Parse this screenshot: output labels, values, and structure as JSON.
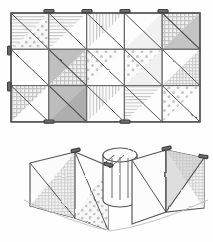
{
  "illustration": {
    "title": "Pencil sketch of a half-square-triangle patchwork quilt",
    "subtitle": "Flat quilt grid above, folded three-dimensional view below",
    "medium": "graphite pencil line drawing",
    "background_color": "#fefefe",
    "ink_color": "#4a4a4a",
    "canvas": {
      "width": 213,
      "height": 242
    }
  },
  "flat_quilt": {
    "label": "flat quilt layout",
    "rows": 3,
    "columns": 5,
    "bounds": {
      "x": 11,
      "y": 13,
      "width": 189,
      "height": 109
    },
    "cell_width": 37.8,
    "cell_height": 36.3,
    "diagonal_direction": "top-left to bottom-right",
    "pin_count": 8,
    "fill_palette": {
      "plain": "#fbfbfb",
      "light": "#f0f0f0",
      "gray": "#c9c9c9",
      "mid_gray": "#b5b5b5",
      "dots": "#f4f4f4",
      "check": "#ededed",
      "hstripe": "#f7f7f7",
      "vstripe": "#f7f7f7"
    },
    "cells": [
      {
        "row": 0,
        "col": 0,
        "upper": "hstripe",
        "lower": "dots"
      },
      {
        "row": 0,
        "col": 1,
        "upper": "hstripe",
        "lower": "plain"
      },
      {
        "row": 0,
        "col": 2,
        "upper": "vstripe",
        "lower": "plain"
      },
      {
        "row": 0,
        "col": 3,
        "upper": "plain",
        "lower": "light"
      },
      {
        "row": 0,
        "col": 4,
        "upper": "check",
        "lower": "gray"
      },
      {
        "row": 1,
        "col": 0,
        "upper": "plain",
        "lower": "plain"
      },
      {
        "row": 1,
        "col": 1,
        "upper": "gray",
        "lower": "check"
      },
      {
        "row": 1,
        "col": 2,
        "upper": "dots",
        "lower": "plain"
      },
      {
        "row": 1,
        "col": 3,
        "upper": "dots",
        "lower": "light"
      },
      {
        "row": 1,
        "col": 4,
        "upper": "plain",
        "lower": "check"
      },
      {
        "row": 2,
        "col": 0,
        "upper": "check",
        "lower": "plain"
      },
      {
        "row": 2,
        "col": 1,
        "upper": "gray",
        "lower": "mid_gray"
      },
      {
        "row": 2,
        "col": 2,
        "upper": "vstripe",
        "lower": "plain"
      },
      {
        "row": 2,
        "col": 3,
        "upper": "hstripe",
        "lower": "plain"
      },
      {
        "row": 2,
        "col": 4,
        "upper": "dots",
        "lower": "plain"
      }
    ]
  },
  "folded_quilt": {
    "label": "folded three-dimensional quilt view",
    "bounds": {
      "x": 22,
      "y": 140,
      "width": 185,
      "height": 96
    },
    "description": "same quilt shown standing, curved into an S-shape with a cylindrical fold at centre",
    "panels": [
      {
        "name": "left-panel",
        "fill": "light",
        "pattern": "check"
      },
      {
        "name": "left-front-panel",
        "fill": "plain",
        "pattern": "dots"
      },
      {
        "name": "centre-cylinder",
        "fill": "plain",
        "pattern": "none"
      },
      {
        "name": "right-front-panel",
        "fill": "plain",
        "pattern": "none"
      },
      {
        "name": "right-panel",
        "fill": "light",
        "pattern": "check"
      }
    ],
    "pin_count": 4
  }
}
